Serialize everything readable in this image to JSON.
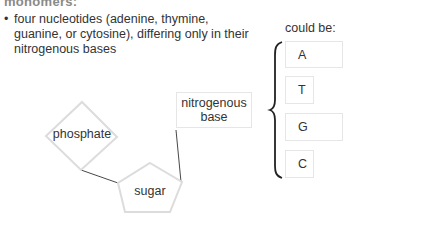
{
  "heading": "monomers:",
  "bullet": {
    "marker": "•",
    "lines": [
      "four nucleotides (adenine, thymine,",
      "guanine, or cytosine), differing only in their",
      "nitrogenous bases"
    ]
  },
  "diagram": {
    "phosphate_label": "phosphate",
    "sugar_label": "sugar",
    "nitrogenous_base_label_line1": "nitrogenous",
    "nitrogenous_base_label_line2": "base",
    "shape_stroke_color": "#dcdcdc",
    "connector_color": "#333333"
  },
  "bases": {
    "caption": "could be:",
    "items": [
      {
        "label": "A"
      },
      {
        "label": "T"
      },
      {
        "label": "G"
      },
      {
        "label": "C"
      }
    ]
  }
}
